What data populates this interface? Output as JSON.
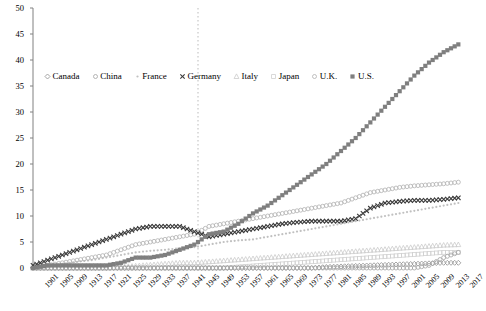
{
  "chart_data": {
    "type": "scatter",
    "title": "",
    "xlabel": "",
    "ylabel": "",
    "xlim": [
      1901,
      2018
    ],
    "ylim": [
      0,
      50
    ],
    "yticks": [
      0,
      5,
      10,
      15,
      20,
      25,
      30,
      35,
      40,
      45,
      50
    ],
    "xticks": [
      1901,
      1905,
      1909,
      1913,
      1917,
      1921,
      1925,
      1929,
      1933,
      1937,
      1941,
      1945,
      1949,
      1953,
      1957,
      1961,
      1965,
      1969,
      1973,
      1977,
      1981,
      1985,
      1989,
      1993,
      1997,
      2001,
      2005,
      2009,
      2013,
      2017
    ],
    "grid": false,
    "legend_position": "upper-left-inside",
    "annotations": [
      {
        "type": "vertical-dashed-line",
        "x": 1946,
        "color": "#bbbbbb"
      }
    ],
    "series": [
      {
        "name": "Canada",
        "marker": "open-diamond",
        "color": "#9a9a9a",
        "x": [
          1901,
          1905,
          1909,
          1913,
          1917,
          1921,
          1925,
          1929,
          1933,
          1937,
          1941,
          1945,
          1949,
          1953,
          1957,
          1961,
          1965,
          1969,
          1973,
          1977,
          1981,
          1985,
          1989,
          1993,
          1997,
          2001,
          2005,
          2009,
          2013,
          2017
        ],
        "values": [
          0,
          0,
          0,
          0,
          0,
          0,
          0,
          0,
          0,
          0,
          0,
          0,
          0,
          0,
          0,
          0,
          0,
          0,
          0,
          0,
          0.2,
          0.3,
          0.4,
          0.5,
          0.6,
          0.7,
          0.8,
          0.9,
          1.0,
          1.0
        ]
      },
      {
        "name": "China",
        "marker": "open-circle",
        "color": "#a8a8a8",
        "x": [
          1901,
          1905,
          1909,
          1913,
          1917,
          1921,
          1925,
          1929,
          1933,
          1937,
          1941,
          1945,
          1949,
          1953,
          1957,
          1961,
          1965,
          1969,
          1973,
          1977,
          1981,
          1985,
          1989,
          1993,
          1997,
          2001,
          2005,
          2009,
          2013,
          2017
        ],
        "values": [
          0,
          0,
          0,
          0,
          0,
          0,
          0,
          0,
          0,
          0,
          0,
          0,
          0,
          0,
          0,
          0,
          0,
          0,
          0,
          0,
          0,
          0,
          0,
          0,
          0,
          0,
          0,
          0.5,
          2.0,
          3.0
        ]
      },
      {
        "name": "France",
        "marker": "small-dot",
        "color": "#c0c0c0",
        "x": [
          1901,
          1905,
          1909,
          1913,
          1917,
          1921,
          1925,
          1929,
          1933,
          1937,
          1941,
          1945,
          1949,
          1953,
          1957,
          1961,
          1965,
          1969,
          1973,
          1977,
          1981,
          1985,
          1989,
          1993,
          1997,
          2001,
          2005,
          2009,
          2013,
          2017
        ],
        "values": [
          0,
          0.3,
          0.8,
          1.2,
          1.5,
          2.0,
          2.5,
          3.0,
          3.3,
          3.5,
          3.8,
          4.0,
          4.5,
          5.0,
          5.3,
          5.5,
          6.0,
          6.5,
          7.0,
          7.5,
          8.0,
          8.5,
          9.0,
          9.5,
          10.0,
          10.5,
          11.0,
          11.5,
          12.0,
          12.5
        ]
      },
      {
        "name": "Germany",
        "marker": "x-cross",
        "color": "#3a3a3a",
        "x": [
          1901,
          1905,
          1909,
          1913,
          1917,
          1921,
          1925,
          1929,
          1933,
          1937,
          1941,
          1945,
          1949,
          1953,
          1957,
          1961,
          1965,
          1969,
          1973,
          1977,
          1981,
          1985,
          1989,
          1993,
          1997,
          2001,
          2005,
          2009,
          2013,
          2017
        ],
        "values": [
          0.5,
          1.5,
          2.5,
          3.5,
          4.5,
          5.5,
          6.5,
          7.5,
          8.0,
          8.0,
          8.0,
          7.0,
          6.0,
          6.5,
          7.0,
          7.5,
          8.0,
          8.5,
          8.8,
          9.0,
          9.0,
          9.0,
          9.5,
          11.5,
          12.5,
          12.8,
          13.0,
          13.0,
          13.2,
          13.5
        ]
      },
      {
        "name": "Italy",
        "marker": "open-triangle",
        "color": "#cccccc",
        "x": [
          1901,
          1905,
          1909,
          1913,
          1917,
          1921,
          1925,
          1929,
          1933,
          1937,
          1941,
          1945,
          1949,
          1953,
          1957,
          1961,
          1965,
          1969,
          1973,
          1977,
          1981,
          1985,
          1989,
          1993,
          1997,
          2001,
          2005,
          2009,
          2013,
          2017
        ],
        "values": [
          0,
          0,
          0,
          0,
          0,
          0,
          0.2,
          0.4,
          0.6,
          0.8,
          1.0,
          1.0,
          1.2,
          1.4,
          1.6,
          1.8,
          2.0,
          2.2,
          2.4,
          2.6,
          2.8,
          3.0,
          3.2,
          3.4,
          3.6,
          3.8,
          4.0,
          4.2,
          4.4,
          4.5
        ]
      },
      {
        "name": "Japan",
        "marker": "small-square-open",
        "color": "#d0d0d0",
        "x": [
          1901,
          1905,
          1909,
          1913,
          1917,
          1921,
          1925,
          1929,
          1933,
          1937,
          1941,
          1945,
          1949,
          1953,
          1957,
          1961,
          1965,
          1969,
          1973,
          1977,
          1981,
          1985,
          1989,
          1993,
          1997,
          2001,
          2005,
          2009,
          2013,
          2017
        ],
        "values": [
          0,
          0,
          0,
          0,
          0,
          0,
          0,
          0,
          0,
          0,
          0,
          0,
          0,
          0,
          0.2,
          0.4,
          0.6,
          0.8,
          1.0,
          1.2,
          1.4,
          1.6,
          1.8,
          2.0,
          2.2,
          2.4,
          2.6,
          2.8,
          3.0,
          3.0
        ]
      },
      {
        "name": "U.K.",
        "marker": "open-circle-light",
        "color": "#b5b5b5",
        "x": [
          1901,
          1905,
          1909,
          1913,
          1917,
          1921,
          1925,
          1929,
          1933,
          1937,
          1941,
          1945,
          1949,
          1953,
          1957,
          1961,
          1965,
          1969,
          1973,
          1977,
          1981,
          1985,
          1989,
          1993,
          1997,
          2001,
          2005,
          2009,
          2013,
          2017
        ],
        "values": [
          0,
          0.5,
          1.0,
          1.5,
          2.0,
          2.5,
          3.5,
          4.5,
          5.0,
          5.5,
          6.0,
          6.5,
          8.0,
          8.5,
          9.0,
          9.5,
          10.0,
          10.5,
          11.0,
          11.5,
          12.0,
          12.5,
          13.5,
          14.5,
          15.0,
          15.5,
          15.8,
          16.0,
          16.2,
          16.5
        ]
      },
      {
        "name": "U.S.",
        "marker": "filled-square",
        "color": "#7f7f7f",
        "x": [
          1901,
          1905,
          1909,
          1913,
          1917,
          1921,
          1925,
          1929,
          1933,
          1937,
          1941,
          1945,
          1949,
          1953,
          1957,
          1961,
          1965,
          1969,
          1973,
          1977,
          1981,
          1985,
          1989,
          1993,
          1997,
          2001,
          2005,
          2009,
          2013,
          2017
        ],
        "values": [
          0,
          0.5,
          0.5,
          0.5,
          0.5,
          0.5,
          1.0,
          2.0,
          2.0,
          2.5,
          3.5,
          4.5,
          6.5,
          7.0,
          8.5,
          10.5,
          12.0,
          14.0,
          16.0,
          18.0,
          20.0,
          22.5,
          25.0,
          28.0,
          31.0,
          34.0,
          37.0,
          39.5,
          41.5,
          43.0
        ]
      }
    ]
  },
  "legend": {
    "items": [
      {
        "label": "Canada",
        "marker": "open-diamond-icon"
      },
      {
        "label": "China",
        "marker": "open-circle-icon"
      },
      {
        "label": "France",
        "marker": "small-dot-icon"
      },
      {
        "label": "Germany",
        "marker": "x-cross-icon"
      },
      {
        "label": "Italy",
        "marker": "open-triangle-icon"
      },
      {
        "label": "Japan",
        "marker": "small-square-icon"
      },
      {
        "label": "U.K.",
        "marker": "open-circle-light-icon"
      },
      {
        "label": "U.S.",
        "marker": "filled-square-icon"
      }
    ]
  },
  "axes": {
    "y_tick_labels": [
      "50",
      "45",
      "40",
      "35",
      "30",
      "25",
      "20",
      "15",
      "10",
      "5",
      "0"
    ],
    "x_tick_labels": [
      "1901",
      "1905",
      "1909",
      "1913",
      "1917",
      "1921",
      "1925",
      "1929",
      "1933",
      "1937",
      "1941",
      "1945",
      "1949",
      "1953",
      "1957",
      "1961",
      "1965",
      "1969",
      "1973",
      "1977",
      "1981",
      "1985",
      "1989",
      "1993",
      "1997",
      "2001",
      "2005",
      "2009",
      "2013",
      "2017"
    ]
  },
  "colors": {
    "axis": "#808080",
    "dashed_line": "#bbbbbb",
    "us": "#7f7f7f",
    "germany": "#3a3a3a"
  }
}
